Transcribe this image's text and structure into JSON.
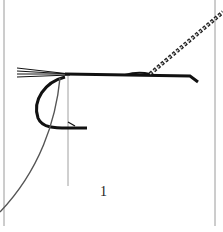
{
  "figure": {
    "step_number": "1",
    "colors": {
      "background": "#ffffff",
      "ink": "#111111",
      "guide_line": "#9a9a9a"
    }
  }
}
